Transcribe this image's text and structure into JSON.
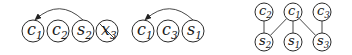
{
  "colors": {
    "stroke": "#2a2a2a",
    "text": "#1a1a1a",
    "background": "#ffffff"
  },
  "sequences": [
    {
      "nodes": [
        {
          "id": "c1",
          "letter": "c",
          "sub": "1",
          "x": 33,
          "y": 31,
          "crossed": false
        },
        {
          "id": "c2",
          "letter": "c",
          "sub": "2",
          "x": 58,
          "y": 31,
          "crossed": false
        },
        {
          "id": "s2",
          "letter": "s",
          "sub": "2",
          "x": 83,
          "y": 31,
          "crossed": false
        },
        {
          "id": "x3",
          "letter": "x",
          "sub": "3",
          "x": 107,
          "y": 31,
          "crossed": true
        }
      ],
      "arc": {
        "from": "s2",
        "to": "c1"
      }
    },
    {
      "nodes": [
        {
          "id": "c1",
          "letter": "c",
          "sub": "1",
          "x": 143,
          "y": 31,
          "crossed": false
        },
        {
          "id": "c3",
          "letter": "c",
          "sub": "3",
          "x": 168,
          "y": 31,
          "crossed": false
        },
        {
          "id": "s1",
          "letter": "s",
          "sub": "1",
          "x": 193,
          "y": 31,
          "crossed": false
        }
      ],
      "arc": {
        "from": "s1",
        "to": "c1"
      }
    }
  ],
  "graph": {
    "nodes": [
      {
        "id": "c2",
        "letter": "c",
        "sub": "2",
        "x": 264,
        "y": 12
      },
      {
        "id": "c1",
        "letter": "c",
        "sub": "1",
        "x": 293,
        "y": 12
      },
      {
        "id": "c3",
        "letter": "c",
        "sub": "3",
        "x": 322,
        "y": 12
      },
      {
        "id": "s2",
        "letter": "s",
        "sub": "2",
        "x": 264,
        "y": 42
      },
      {
        "id": "s1",
        "letter": "s",
        "sub": "1",
        "x": 293,
        "y": 42
      },
      {
        "id": "s3",
        "letter": "s",
        "sub": "3",
        "x": 322,
        "y": 42
      }
    ],
    "edges": [
      [
        "c2",
        "s2"
      ],
      [
        "c1",
        "s2"
      ],
      [
        "c1",
        "s1"
      ],
      [
        "c1",
        "s3"
      ],
      [
        "c3",
        "s3"
      ]
    ]
  }
}
